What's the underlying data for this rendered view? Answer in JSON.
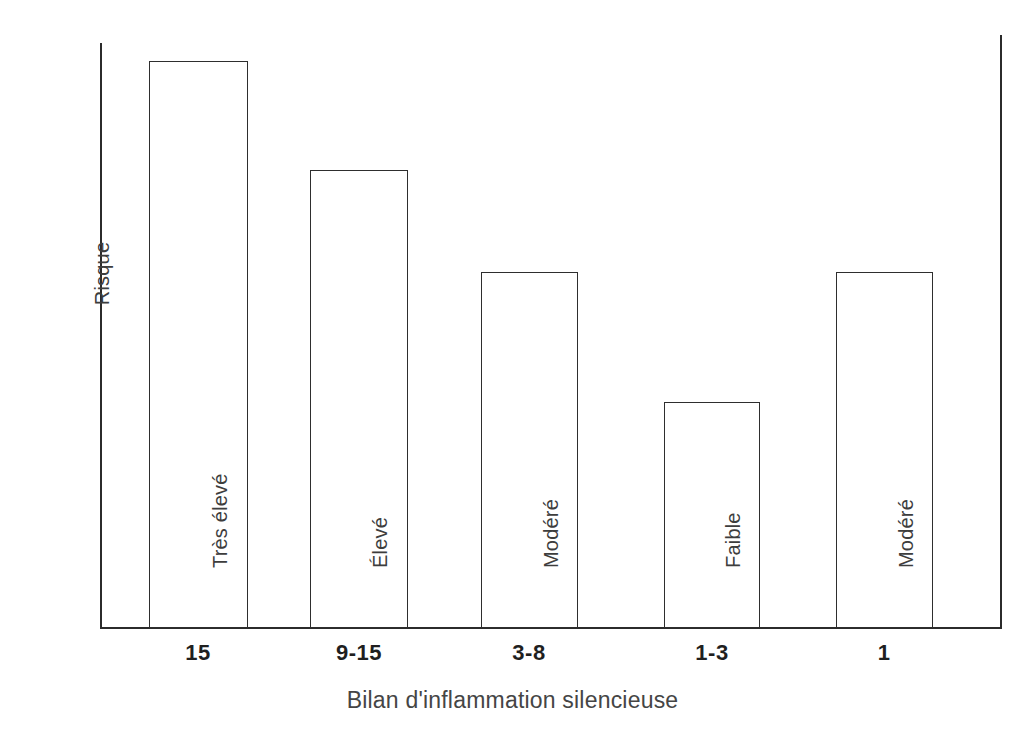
{
  "chart_data": {
    "type": "bar",
    "title": "",
    "subtitle": "",
    "xlabel": "Bilan d'inflammation silencieuse",
    "ylabel": "Risque",
    "categories": [
      "15",
      "9-15",
      "3-8",
      "1-3",
      "1"
    ],
    "values": [
      100,
      80.7,
      62.7,
      39.6,
      62.7
    ],
    "bar_labels": [
      "Très élevé",
      "Élevé",
      "Modéré",
      "Faible",
      "Modéré"
    ],
    "ylim": [
      0,
      100
    ],
    "yticks": [],
    "ytick_labels": [],
    "grid": false,
    "legend": false,
    "legend_position": "none",
    "bar_fill": "#ffffff",
    "bar_edge_color": "#2e2e2e",
    "axis_color": "#2b2b2b",
    "background": "#ffffff"
  },
  "axes": {
    "y_title": "Risque",
    "x_title": "Bilan d'inflammation silencieuse"
  },
  "bars": [
    {
      "category": "15",
      "label": "Très élevé",
      "value": 100,
      "x": 149,
      "width": 99,
      "top": 61
    },
    {
      "category": "9-15",
      "label": "Élevé",
      "value": 80.7,
      "x": 310,
      "width": 98,
      "top": 170
    },
    {
      "category": "3-8",
      "label": "Modéré",
      "value": 62.7,
      "x": 481,
      "width": 97,
      "top": 272
    },
    {
      "category": "1-3",
      "label": "Faible",
      "value": 39.6,
      "x": 664,
      "width": 96,
      "top": 402
    },
    {
      "category": "1",
      "label": "Modéré",
      "value": 62.7,
      "x": 836,
      "width": 97,
      "top": 272
    }
  ],
  "x_ticks": [
    {
      "label": "15",
      "center": 198
    },
    {
      "label": "9-15",
      "center": 359
    },
    {
      "label": "3-8",
      "center": 529
    },
    {
      "label": "1-3",
      "center": 712
    },
    {
      "label": "1",
      "center": 884
    }
  ]
}
